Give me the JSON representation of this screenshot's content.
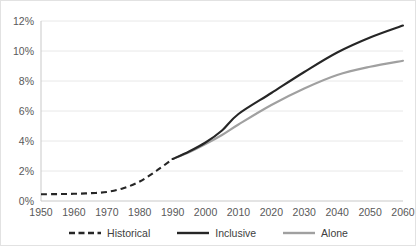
{
  "chart_data": {
    "type": "line",
    "title": "",
    "subtitle": "",
    "xlabel": "",
    "ylabel": "",
    "xlim": [
      1950,
      2060
    ],
    "ylim": [
      0,
      12
    ],
    "grid": "horizontal",
    "legend_position": "bottom",
    "x_tick_labels": [
      "1950",
      "1960",
      "1970",
      "1980",
      "1990",
      "2000",
      "2010",
      "2020",
      "2030",
      "2040",
      "2050",
      "2060"
    ],
    "y_tick_labels": [
      "0%",
      "2%",
      "4%",
      "6%",
      "8%",
      "10%",
      "12%"
    ],
    "y_tick_values": [
      0,
      2,
      4,
      6,
      8,
      10,
      12
    ],
    "value_unit": "%",
    "series": [
      {
        "name": "Historical",
        "style": "dashed",
        "color": "#262626",
        "x": [
          1950,
          1955,
          1960,
          1965,
          1970,
          1975,
          1980,
          1985,
          1990
        ],
        "values": [
          0.45,
          0.46,
          0.48,
          0.52,
          0.6,
          0.85,
          1.3,
          2.0,
          2.8
        ]
      },
      {
        "name": "Inclusive",
        "style": "solid",
        "color": "#262626",
        "x": [
          1990,
          1995,
          2000,
          2005,
          2010,
          2020,
          2030,
          2040,
          2050,
          2060
        ],
        "values": [
          2.8,
          3.3,
          3.9,
          4.7,
          5.8,
          7.2,
          8.6,
          9.9,
          10.9,
          11.7
        ]
      },
      {
        "name": "Alone",
        "style": "solid",
        "color": "#a0a0a0",
        "x": [
          1990,
          1995,
          2000,
          2005,
          2010,
          2020,
          2030,
          2040,
          2050,
          2060
        ],
        "values": [
          2.8,
          3.25,
          3.8,
          4.4,
          5.1,
          6.4,
          7.5,
          8.4,
          8.95,
          9.35
        ]
      }
    ]
  },
  "legend": {
    "entries": [
      {
        "label": "Historical",
        "icon": "dashed-line-swatch"
      },
      {
        "label": "Inclusive",
        "icon": "solid-line-swatch"
      },
      {
        "label": "Alone",
        "icon": "solid-line-swatch"
      }
    ]
  },
  "colors": {
    "historical": "#262626",
    "inclusive": "#262626",
    "alone": "#a0a0a0",
    "gridline": "#e8e8e8",
    "axis": "#c9c9c9",
    "text": "#595959",
    "background": "#ffffff",
    "border": "#e2e2e2"
  }
}
